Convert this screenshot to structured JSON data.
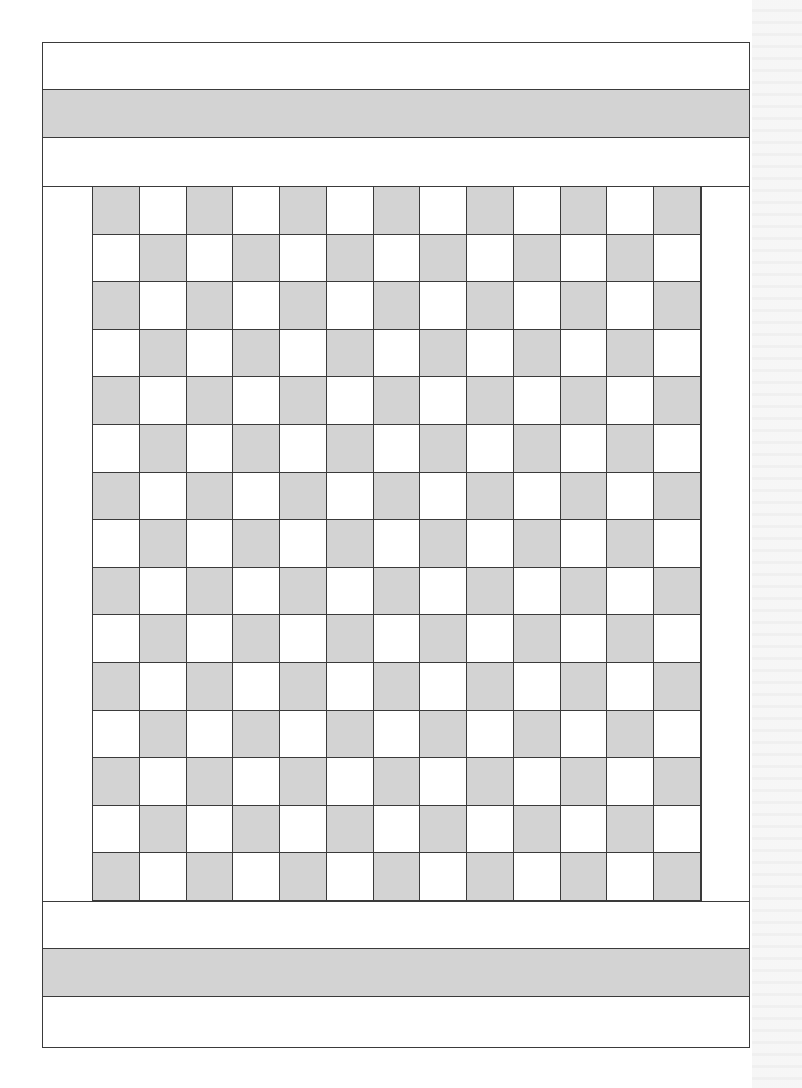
{
  "diagram": {
    "type": "quilt-layout",
    "colors": {
      "dark": "#d3d3d3",
      "light": "#ffffff",
      "line": "#3a3a3a"
    },
    "top_border_bands": [
      {
        "fill": "light",
        "height": 47
      },
      {
        "fill": "dark",
        "height": 48
      },
      {
        "fill": "light",
        "height": 49
      }
    ],
    "center_grid": {
      "rows": 15,
      "cols": 13,
      "pattern": "checkerboard",
      "top_left_fill": "dark"
    },
    "bottom_border_bands": [
      {
        "fill": "light",
        "height": 48
      },
      {
        "fill": "dark",
        "height": 48
      },
      {
        "fill": "light",
        "height": 49
      }
    ]
  }
}
